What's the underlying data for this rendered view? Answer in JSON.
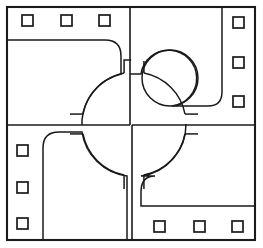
{
  "diagram": {
    "canvas": {
      "width": 263,
      "height": 248,
      "background_color": "#ffffff",
      "line_color": "#1a1a1a"
    },
    "frame": {
      "name": "outer-boundary",
      "x": 7,
      "y": 7,
      "width": 248,
      "height": 233,
      "stroke_width": 2.1
    },
    "dividers": [
      {
        "name": "vertical-divider-upper",
        "orientation": "vertical",
        "x": 130,
        "y1": 7,
        "y2": 125
      },
      {
        "name": "vertical-divider-lower",
        "orientation": "vertical",
        "x": 132,
        "y1": 125,
        "y2": 240
      },
      {
        "name": "horizontal-divider-left",
        "orientation": "horizontal",
        "y": 125,
        "x1": 7,
        "x2": 130
      },
      {
        "name": "horizontal-divider-right",
        "orientation": "horizontal",
        "y": 125,
        "x1": 132,
        "x2": 255
      }
    ],
    "circles": [
      {
        "name": "central-rotunda",
        "cx": 134,
        "cy": 124,
        "r": 52
      },
      {
        "name": "secondary-rotunda",
        "cx": 170,
        "cy": 78,
        "r": 28
      }
    ],
    "regions": [
      {
        "name": "top-left-room",
        "corner_style": "rounded",
        "description": "Upper left chamber with rounded inner corner meeting central rotunda"
      },
      {
        "name": "top-right-room",
        "corner_style": "rounded",
        "description": "Upper right chamber enclosing the secondary rotunda"
      },
      {
        "name": "bottom-left-room",
        "corner_style": "rounded",
        "description": "Lower left chamber with rounded top corner"
      },
      {
        "name": "bottom-right-room",
        "corner_style": "rounded",
        "description": "Lower right chamber with rounded top-left corner"
      }
    ],
    "markers": {
      "name": "perimeter-squares",
      "size": 11,
      "count": 12,
      "groups": [
        {
          "name": "top-marker-row",
          "edge": "top",
          "items": [
            {
              "x": 22,
              "y": 15
            },
            {
              "x": 61,
              "y": 15
            },
            {
              "x": 99,
              "y": 15
            }
          ]
        },
        {
          "name": "right-marker-column",
          "edge": "right",
          "items": [
            {
              "x": 233,
              "y": 17
            },
            {
              "x": 233,
              "y": 57
            },
            {
              "x": 233,
              "y": 96
            }
          ]
        },
        {
          "name": "left-marker-column",
          "edge": "left",
          "items": [
            {
              "x": 17,
              "y": 145
            },
            {
              "x": 17,
              "y": 182
            },
            {
              "x": 17,
              "y": 218
            }
          ]
        },
        {
          "name": "bottom-marker-row",
          "edge": "bottom",
          "items": [
            {
              "x": 154,
              "y": 221
            },
            {
              "x": 194,
              "y": 221
            },
            {
              "x": 232,
              "y": 221
            }
          ]
        }
      ]
    }
  }
}
